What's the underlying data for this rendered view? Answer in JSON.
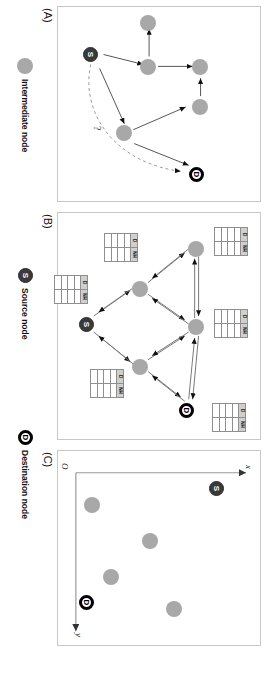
{
  "figure": {
    "panels": [
      {
        "id": "A",
        "label": "(A)"
      },
      {
        "id": "B",
        "label": "(B)"
      },
      {
        "id": "C",
        "label": "(C)"
      }
    ]
  },
  "legend": {
    "items": [
      {
        "key": "intermediate",
        "label": "Intermediate node",
        "glyph": "",
        "icon": "circle-gray-icon",
        "color": "#a8a8a8"
      },
      {
        "key": "source",
        "label": "Source node",
        "glyph": "S",
        "icon": "circle-source-icon",
        "color": "#3a3a3a"
      },
      {
        "key": "destination",
        "label": "Destination node",
        "glyph": "D",
        "icon": "circle-destination-icon",
        "color": "#000000"
      }
    ]
  },
  "panel_a": {
    "label": "(A)",
    "nodes": [
      {
        "id": "s",
        "type": "source",
        "glyph": "S"
      },
      {
        "id": "n1",
        "type": "intermediate",
        "glyph": ""
      },
      {
        "id": "n2",
        "type": "intermediate",
        "glyph": ""
      },
      {
        "id": "n3",
        "type": "intermediate",
        "glyph": ""
      },
      {
        "id": "n4",
        "type": "intermediate",
        "glyph": ""
      },
      {
        "id": "n5",
        "type": "intermediate",
        "glyph": ""
      },
      {
        "id": "d",
        "type": "destination",
        "glyph": "D"
      }
    ],
    "annotation": "?"
  },
  "panel_b": {
    "label": "(B)",
    "nodes": [
      {
        "id": "s",
        "type": "source",
        "glyph": "S"
      },
      {
        "id": "b1",
        "type": "intermediate",
        "glyph": ""
      },
      {
        "id": "b2",
        "type": "intermediate",
        "glyph": ""
      },
      {
        "id": "b3",
        "type": "intermediate",
        "glyph": ""
      },
      {
        "id": "b4",
        "type": "intermediate",
        "glyph": ""
      },
      {
        "id": "d",
        "type": "destination",
        "glyph": "D"
      }
    ],
    "routing_table": {
      "headers": [
        "D",
        "NH"
      ],
      "rows": [
        [
          "",
          ""
        ],
        [
          "",
          ""
        ],
        [
          "",
          ""
        ],
        [
          "",
          ""
        ]
      ]
    },
    "table_count": 5
  },
  "panel_c": {
    "label": "(C)",
    "axes": {
      "x_label": "x",
      "y_label": "y",
      "origin_label": "O"
    },
    "nodes": [
      {
        "id": "s",
        "type": "source",
        "glyph": "S",
        "x": 0.93,
        "y": 0.09
      },
      {
        "id": "c1",
        "type": "intermediate",
        "glyph": "",
        "x": 0.17,
        "y": 0.13
      },
      {
        "id": "c2",
        "type": "intermediate",
        "glyph": "",
        "x": 0.44,
        "y": 0.3
      },
      {
        "id": "c3",
        "type": "intermediate",
        "glyph": "",
        "x": 0.76,
        "y": 0.44
      },
      {
        "id": "c4",
        "type": "intermediate",
        "glyph": "",
        "x": 0.52,
        "y": 0.77
      },
      {
        "id": "d",
        "type": "destination",
        "glyph": "D",
        "x": 0.18,
        "y": 0.8
      }
    ]
  }
}
